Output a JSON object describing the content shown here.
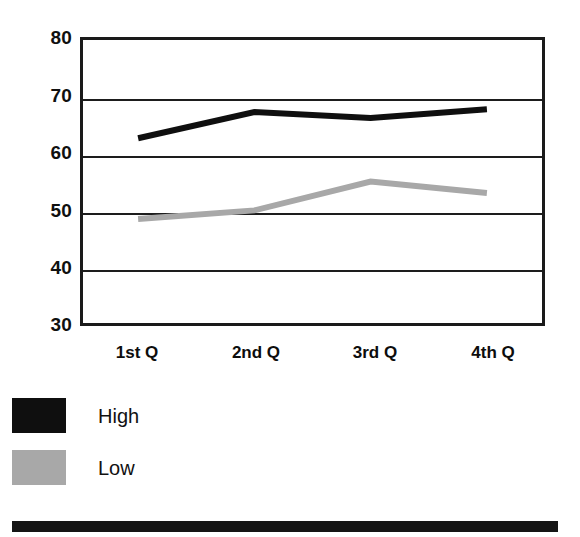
{
  "chart_data": {
    "type": "line",
    "title": "",
    "subtitle": "",
    "xlabel": "",
    "ylabel": "",
    "categories": [
      "1st Q",
      "2nd Q",
      "3rd Q",
      "4th Q"
    ],
    "series": [
      {
        "name": "High",
        "values": [
          62.5,
          67,
          66,
          67.5
        ],
        "color": "#0f0f0f"
      },
      {
        "name": "Low",
        "values": [
          48.5,
          50,
          55,
          53
        ],
        "color": "#a8a8a8"
      }
    ],
    "ylim": [
      30,
      80
    ],
    "yticks": [
      30,
      40,
      50,
      60,
      70,
      80
    ],
    "ytick_labels": [
      "30",
      "40",
      "50",
      "60",
      "70",
      "80"
    ],
    "grid": true,
    "grid_axis": "y",
    "legend_position": "below-left",
    "annotations": []
  },
  "axis": {
    "y_ticks": [
      {
        "label": "80"
      },
      {
        "label": "70"
      },
      {
        "label": "60"
      },
      {
        "label": "50"
      },
      {
        "label": "40"
      },
      {
        "label": "30"
      }
    ],
    "x_ticks": [
      {
        "label": "1st Q"
      },
      {
        "label": "2nd Q"
      },
      {
        "label": "3rd Q"
      },
      {
        "label": "4th Q"
      }
    ]
  },
  "legend": {
    "entries": [
      {
        "label": "High",
        "swatch": "black-swatch",
        "color": "#0f0f0f"
      },
      {
        "label": "Low",
        "swatch": "gray-swatch",
        "color": "#a8a8a8"
      }
    ]
  },
  "colors": {
    "high_series": "#0f0f0f",
    "low_series": "#a8a8a8",
    "frame": "#1a1a1a",
    "gridline": "#1d1d1d",
    "bottom_bar": "#151515",
    "background": "#ffffff"
  }
}
